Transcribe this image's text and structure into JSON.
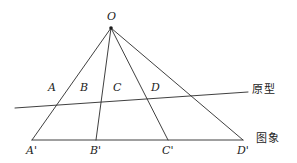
{
  "figure": {
    "width": 297,
    "height": 163,
    "background_color": "#ffffff",
    "stroke_color": "#2a2a2a",
    "text_color": "#1c1c1c",
    "type": "central-projection-geometry-diagram"
  },
  "apex": {
    "label": "O",
    "x": 111,
    "y": 28,
    "label_x": 107,
    "label_y": 11,
    "dot_radius": 1.8
  },
  "baseline": {
    "name": "image-line",
    "annotation": "图象",
    "annotation_x": 256,
    "annotation_y": 133,
    "x1": 32,
    "y1": 140,
    "x2": 243,
    "y2": 140
  },
  "oblique_line": {
    "name": "prototype-line",
    "annotation": "原型",
    "annotation_x": 252,
    "annotation_y": 84,
    "x1": 15,
    "y1": 108,
    "x2": 248,
    "y2": 92
  },
  "rays": [
    {
      "name": "ray-OA",
      "to_label": "A'",
      "x2": 32,
      "y2": 140
    },
    {
      "name": "ray-OB",
      "to_label": "B'",
      "x2": 96,
      "y2": 140
    },
    {
      "name": "ray-OC",
      "to_label": "C'",
      "x2": 168,
      "y2": 140
    },
    {
      "name": "ray-OD",
      "to_label": "D'",
      "x2": 243,
      "y2": 140
    }
  ],
  "prototype_points": [
    {
      "label": "A",
      "label_x": 48,
      "label_y": 82
    },
    {
      "label": "B",
      "label_x": 80,
      "label_y": 82
    },
    {
      "label": "C",
      "label_x": 113,
      "label_y": 82
    },
    {
      "label": "D",
      "label_x": 151,
      "label_y": 82
    }
  ],
  "image_points": [
    {
      "label": "A'",
      "label_x": 26,
      "label_y": 145
    },
    {
      "label": "B'",
      "label_x": 90,
      "label_y": 145
    },
    {
      "label": "C'",
      "label_x": 162,
      "label_y": 145
    },
    {
      "label": "D'",
      "label_x": 237,
      "label_y": 145
    }
  ]
}
